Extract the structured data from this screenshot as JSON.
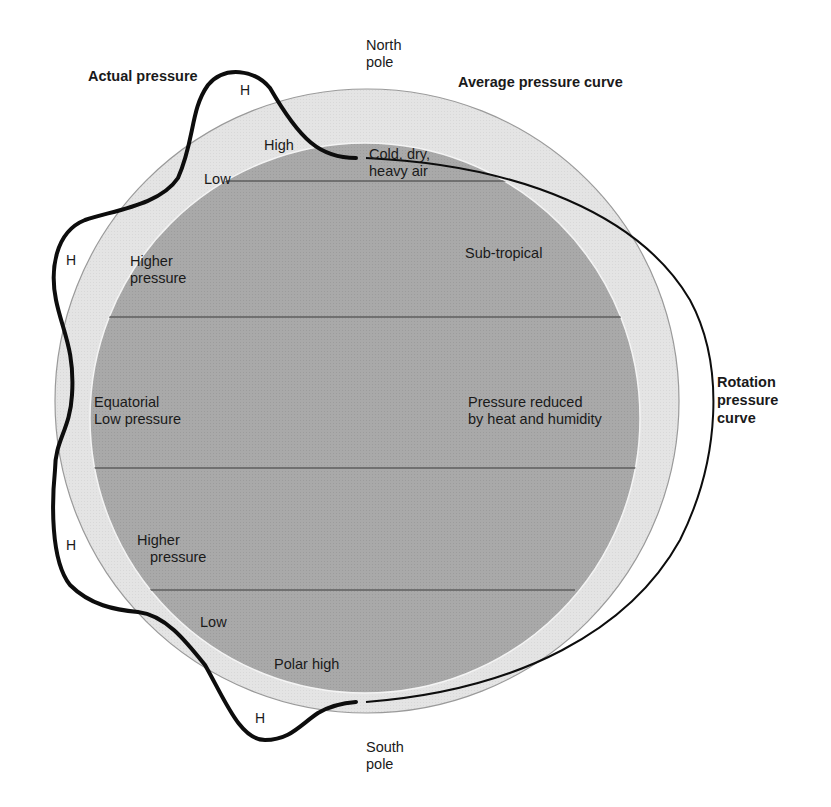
{
  "diagram": {
    "type": "earth-pressure-belts",
    "colors": {
      "background": "#ffffff",
      "outer_ring": "#e4e4e4",
      "inner_disk": "#a9a9a9",
      "latitude_lines": "#5e5e5e",
      "curves": "#0d0d0d"
    },
    "title_labels": {
      "actual_pressure": "Actual pressure",
      "average_pressure_curve": "Average pressure curve",
      "rotation_pressure_curve": [
        "Rotation",
        "pressure",
        "curve"
      ]
    },
    "poles": {
      "north": [
        "North",
        "pole"
      ],
      "south": [
        "South",
        "pole"
      ]
    },
    "zone_labels": {
      "north_high": "High",
      "north_low": "Low",
      "cold_dry": [
        "Cold, dry,",
        "heavy air"
      ],
      "north_higher_pressure": [
        "Higher",
        "pressure"
      ],
      "sub_tropical": "Sub-tropical",
      "equatorial": [
        "Equatorial",
        "Low pressure"
      ],
      "pressure_reduced": [
        "Pressure reduced",
        "by heat and humidity"
      ],
      "south_higher_pressure": [
        "Higher",
        "pressure"
      ],
      "south_low": "Low",
      "polar_high": "Polar high"
    },
    "high_markers": [
      "H",
      "H",
      "H",
      "H"
    ]
  }
}
